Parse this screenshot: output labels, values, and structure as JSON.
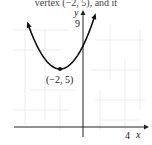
{
  "header": {
    "cut_text": "vertex (−2, 5), and it"
  },
  "chart_data": {
    "type": "line",
    "title": "",
    "xlabel": "x",
    "ylabel": "y",
    "function": "y = 0.5(x + 2)^2 + 5",
    "vertex": {
      "x": -2,
      "y": 5,
      "label": "(−2, 5)"
    },
    "x_tick_labels": [
      "4"
    ],
    "y_tick_labels": [
      "9"
    ],
    "xlim": [
      -7,
      6
    ],
    "ylim": [
      -1,
      10
    ],
    "grid": true,
    "series": [
      {
        "name": "parabola",
        "x": [
          -4.8,
          -4,
          -3,
          -2,
          -1,
          0,
          1.05
        ],
        "y": [
          8.92,
          7.0,
          5.5,
          5.0,
          5.5,
          7.0,
          9.65
        ]
      }
    ]
  },
  "labels": {
    "x_axis": "x",
    "y_axis": "y",
    "x_tick": "4",
    "y_tick": "9",
    "vertex": "(−2, 5)"
  }
}
